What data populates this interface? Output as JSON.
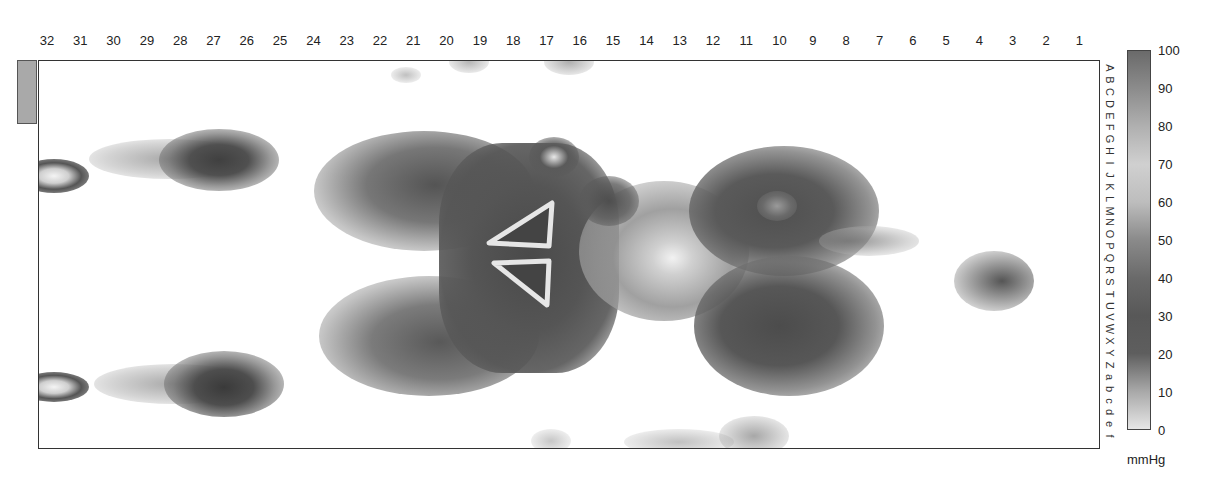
{
  "chart_data": {
    "type": "heatmap",
    "title": "",
    "units": "mmHg",
    "x_tick_labels": [
      "32",
      "31",
      "30",
      "29",
      "28",
      "27",
      "26",
      "25",
      "24",
      "23",
      "22",
      "21",
      "20",
      "19",
      "18",
      "17",
      "16",
      "15",
      "14",
      "13",
      "12",
      "11",
      "10",
      "9",
      "8",
      "7",
      "6",
      "5",
      "4",
      "3",
      "2",
      "1"
    ],
    "y_tick_labels": [
      "A",
      "B",
      "C",
      "D",
      "E",
      "F",
      "G",
      "H",
      "I",
      "J",
      "K",
      "L",
      "M",
      "N",
      "O",
      "P",
      "Q",
      "R",
      "S",
      "T",
      "U",
      "V",
      "W",
      "X",
      "Y",
      "Z",
      "a",
      "b",
      "c",
      "d",
      "e",
      "f"
    ],
    "colorbar": {
      "min": 0,
      "max": 100,
      "ticks": [
        "100",
        "90",
        "80",
        "70",
        "60",
        "50",
        "40",
        "30",
        "20",
        "10",
        "0"
      ],
      "label": "mmHg"
    },
    "regions": [
      {
        "name": "upper-left-edge-ring",
        "cols": "32-31",
        "rows": "H-I",
        "peak_mmHg": 25
      },
      {
        "name": "lower-left-edge-ring",
        "cols": "32-31",
        "rows": "Z-a",
        "peak_mmHg": 25
      },
      {
        "name": "upper-heel-blob",
        "cols": "30-25",
        "rows": "F-I",
        "peak_mmHg": 30
      },
      {
        "name": "lower-heel-blob",
        "cols": "30-25",
        "rows": "Y-b",
        "peak_mmHg": 30
      },
      {
        "name": "central-large-pressure-area",
        "cols": "23-15",
        "rows": "F-Y",
        "peak_mmHg": 35
      },
      {
        "name": "central-triangle-upper",
        "cols": "20-17",
        "rows": "M-Q",
        "peak_mmHg": 70
      },
      {
        "name": "central-triangle-lower",
        "cols": "20-17",
        "rows": "R-U",
        "peak_mmHg": 70
      },
      {
        "name": "bridge-area",
        "cols": "16-12",
        "rows": "J-U",
        "peak_mmHg": 45
      },
      {
        "name": "right-upper-lobe",
        "cols": "12-8",
        "rows": "H-P",
        "peak_mmHg": 30
      },
      {
        "name": "right-lower-lobe",
        "cols": "12-8",
        "rows": "R-Y",
        "peak_mmHg": 30
      },
      {
        "name": "small-spot",
        "cols": "4-3",
        "rows": "S-T",
        "peak_mmHg": 30
      },
      {
        "name": "top-edge-spots",
        "cols": "15-12",
        "rows": "A",
        "peak_mmHg": 60
      },
      {
        "name": "bottom-edge-spots",
        "cols": "16-10",
        "rows": "e-f",
        "peak_mmHg": 65
      }
    ],
    "grid": false,
    "legend_position": "right"
  }
}
